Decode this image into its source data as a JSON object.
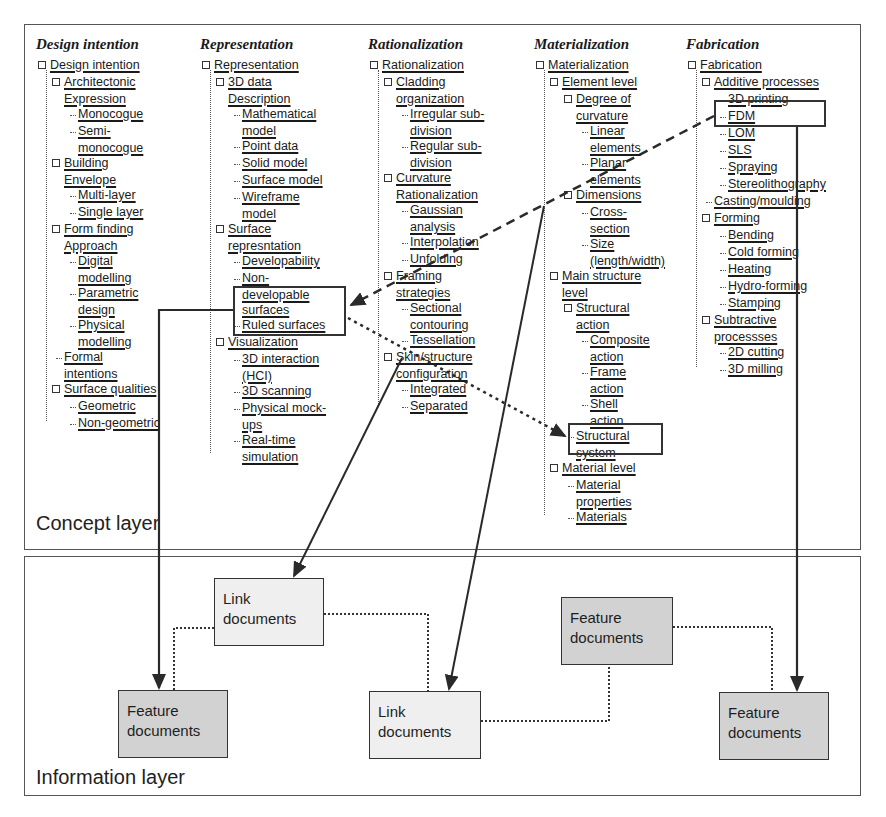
{
  "concept_layer": {
    "label": "Concept layer",
    "columns": [
      {
        "title": "Design intention",
        "root": "Design intention",
        "items": [
          {
            "label": "Architectonic",
            "level": 1,
            "box": true
          },
          {
            "label": "Expression",
            "level": 1,
            "cont": true
          },
          {
            "label": "Monocogue",
            "level": 2
          },
          {
            "label": "Semi-",
            "level": 2
          },
          {
            "label": "monocogue",
            "level": 2,
            "cont": true
          },
          {
            "label": "Building",
            "level": 1,
            "box": true
          },
          {
            "label": "Envelope",
            "level": 1,
            "cont": true
          },
          {
            "label": "Multi-layer",
            "level": 2
          },
          {
            "label": "Single layer",
            "level": 2
          },
          {
            "label": "Form finding",
            "level": 1,
            "box": true
          },
          {
            "label": "Approach",
            "level": 1,
            "cont": true
          },
          {
            "label": "Digital",
            "level": 2
          },
          {
            "label": "modelling",
            "level": 2,
            "cont": true
          },
          {
            "label": "Parametric",
            "level": 2
          },
          {
            "label": "design",
            "level": 2,
            "cont": true
          },
          {
            "label": "Physical",
            "level": 2
          },
          {
            "label": "modelling",
            "level": 2,
            "cont": true
          },
          {
            "label": "Formal",
            "level": 1
          },
          {
            "label": "intentions",
            "level": 1,
            "cont": true
          },
          {
            "label": "Surface qualities",
            "level": 1,
            "box": true
          },
          {
            "label": "Geometric",
            "level": 2
          },
          {
            "label": "Non-geometric",
            "level": 2
          }
        ]
      },
      {
        "title": "Representation",
        "root": "Representation",
        "items": [
          {
            "label": "3D data",
            "level": 1,
            "box": true
          },
          {
            "label": "Description",
            "level": 1,
            "cont": true
          },
          {
            "label": "Mathematical",
            "level": 2
          },
          {
            "label": "model",
            "level": 2,
            "cont": true
          },
          {
            "label": "Point data",
            "level": 2
          },
          {
            "label": "Solid model",
            "level": 2
          },
          {
            "label": "Surface model",
            "level": 2
          },
          {
            "label": "Wireframe",
            "level": 2
          },
          {
            "label": "model",
            "level": 2,
            "cont": true
          },
          {
            "label": "Surface",
            "level": 1,
            "box": true
          },
          {
            "label": "represntation",
            "level": 1,
            "cont": true
          },
          {
            "label": "Developability",
            "level": 2
          },
          {
            "label": "Non-",
            "level": 2
          },
          {
            "label": "developable",
            "level": 2,
            "cont": true
          },
          {
            "label": "surfaces",
            "level": 2,
            "cont": true
          },
          {
            "label": "Ruled surfaces",
            "level": 2
          },
          {
            "label": "Visualization",
            "level": 1,
            "box": true
          },
          {
            "label": "3D interaction",
            "level": 2
          },
          {
            "label": "(HCI)",
            "level": 2,
            "cont": true
          },
          {
            "label": "3D scanning",
            "level": 2
          },
          {
            "label": "Physical mock-",
            "level": 2
          },
          {
            "label": "ups",
            "level": 2,
            "cont": true
          },
          {
            "label": "Real-time",
            "level": 2
          },
          {
            "label": "simulation",
            "level": 2,
            "cont": true
          }
        ]
      },
      {
        "title": "Rationalization",
        "root": "Rationalization",
        "items": [
          {
            "label": "Cladding",
            "level": 1,
            "box": true
          },
          {
            "label": "organization",
            "level": 1,
            "cont": true
          },
          {
            "label": "Irregular sub-",
            "level": 2
          },
          {
            "label": "division",
            "level": 2,
            "cont": true
          },
          {
            "label": "Regular sub-",
            "level": 2
          },
          {
            "label": "division",
            "level": 2,
            "cont": true
          },
          {
            "label": "Curvature",
            "level": 1,
            "box": true
          },
          {
            "label": "Rationalization",
            "level": 1,
            "cont": true
          },
          {
            "label": "Gaussian",
            "level": 2
          },
          {
            "label": "analysis",
            "level": 2,
            "cont": true
          },
          {
            "label": "Interpolation",
            "level": 2
          },
          {
            "label": "Unfolding",
            "level": 2
          },
          {
            "label": "Framing",
            "level": 1,
            "box": true
          },
          {
            "label": "strategies",
            "level": 1,
            "cont": true
          },
          {
            "label": "Sectional",
            "level": 2
          },
          {
            "label": "contouring",
            "level": 2,
            "cont": true
          },
          {
            "label": "Tessellation",
            "level": 2
          },
          {
            "label": "Skin/structure",
            "level": 1,
            "box": true
          },
          {
            "label": "configuration",
            "level": 1,
            "cont": true
          },
          {
            "label": "Integrated",
            "level": 2
          },
          {
            "label": "Separated",
            "level": 2
          }
        ]
      },
      {
        "title": "Materialization",
        "root": "Materialization",
        "items": [
          {
            "label": "Element level",
            "level": 1,
            "box": true
          },
          {
            "label": "Degree of",
            "level": 2,
            "box": true
          },
          {
            "label": "curvature",
            "level": 2,
            "cont": true
          },
          {
            "label": "Linear",
            "level": 3
          },
          {
            "label": "elements",
            "level": 3,
            "cont": true
          },
          {
            "label": "Planar",
            "level": 3
          },
          {
            "label": "elements",
            "level": 3,
            "cont": true
          },
          {
            "label": "Dimensions",
            "level": 2,
            "box": true
          },
          {
            "label": "Cross-",
            "level": 3
          },
          {
            "label": "section",
            "level": 3,
            "cont": true
          },
          {
            "label": "Size",
            "level": 3
          },
          {
            "label": "(length/width)",
            "level": 3,
            "cont": true
          },
          {
            "label": "Main structure",
            "level": 1,
            "box": true
          },
          {
            "label": "level",
            "level": 1,
            "cont": true
          },
          {
            "label": "Structural",
            "level": 2,
            "box": true
          },
          {
            "label": "action",
            "level": 2,
            "cont": true
          },
          {
            "label": "Composite",
            "level": 3
          },
          {
            "label": "action",
            "level": 3,
            "cont": true
          },
          {
            "label": "Frame",
            "level": 3
          },
          {
            "label": "action",
            "level": 3,
            "cont": true
          },
          {
            "label": "Shell",
            "level": 3
          },
          {
            "label": "action",
            "level": 3,
            "cont": true
          },
          {
            "label": "Structural",
            "level": 2
          },
          {
            "label": "system",
            "level": 2,
            "cont": true
          },
          {
            "label": "Material level",
            "level": 1,
            "box": true
          },
          {
            "label": "Material",
            "level": 2
          },
          {
            "label": "properties",
            "level": 2,
            "cont": true
          },
          {
            "label": "Materials",
            "level": 2
          }
        ]
      },
      {
        "title": "Fabrication",
        "root": "Fabrication",
        "items": [
          {
            "label": "Additive processes",
            "level": 1,
            "box": true
          },
          {
            "label": "3D printing",
            "level": 2
          },
          {
            "label": "FDM",
            "level": 2
          },
          {
            "label": "LOM",
            "level": 2
          },
          {
            "label": "SLS",
            "level": 2
          },
          {
            "label": "Spraying",
            "level": 2
          },
          {
            "label": "Stereolithography",
            "level": 2
          },
          {
            "label": "Casting/moulding",
            "level": 1
          },
          {
            "label": "Forming",
            "level": 1,
            "box": true
          },
          {
            "label": "Bending",
            "level": 2
          },
          {
            "label": "Cold forming",
            "level": 2
          },
          {
            "label": "Heating",
            "level": 2
          },
          {
            "label": "Hydro-forming",
            "level": 2
          },
          {
            "label": "Stamping",
            "level": 2
          },
          {
            "label": "Subtractive",
            "level": 1,
            "box": true
          },
          {
            "label": "processses",
            "level": 1,
            "cont": true
          },
          {
            "label": "2D cutting",
            "level": 2
          },
          {
            "label": "3D milling",
            "level": 2
          }
        ]
      }
    ]
  },
  "information_layer": {
    "label": "Information layer",
    "documents": [
      {
        "id": "link-1",
        "type": "link",
        "line1": "Link",
        "line2": "documents"
      },
      {
        "id": "feature-1",
        "type": "feature",
        "line1": "Feature",
        "line2": "documents"
      },
      {
        "id": "link-2",
        "type": "link",
        "line1": "Link",
        "line2": "documents"
      },
      {
        "id": "feature-2",
        "type": "feature",
        "line1": "Feature",
        "line2": "documents"
      },
      {
        "id": "feature-3",
        "type": "feature",
        "line1": "Feature",
        "line2": "documents"
      }
    ]
  },
  "colors": {
    "link_box": "#efefef",
    "feature_box": "#d2d2d2",
    "line": "#2a2a2a"
  }
}
